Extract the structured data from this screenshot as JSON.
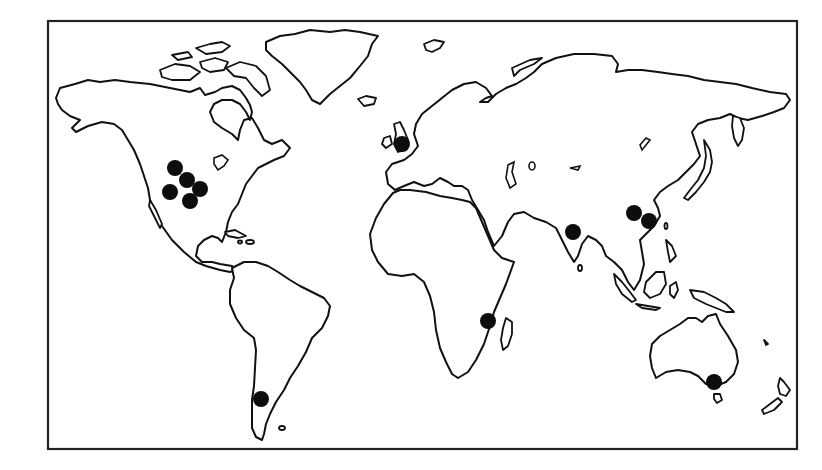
{
  "map": {
    "projection": "world outline map",
    "frame": {
      "x": 48,
      "y": 21,
      "width": 749,
      "height": 428
    },
    "colors": {
      "outline": "#111111",
      "land": "#ffffff",
      "marker": "#0d0d0d",
      "background": "#ffffff"
    },
    "marker_radius": 8,
    "markers": [
      {
        "region": "North America (western USA)",
        "x": 175,
        "y": 168
      },
      {
        "region": "North America (western USA)",
        "x": 187,
        "y": 180
      },
      {
        "region": "North America (western USA)",
        "x": 170,
        "y": 192
      },
      {
        "region": "North America (western USA)",
        "x": 200,
        "y": 189
      },
      {
        "region": "North America (western USA)",
        "x": 190,
        "y": 201
      },
      {
        "region": "Europe (England)",
        "x": 402,
        "y": 144
      },
      {
        "region": "South Asia (India)",
        "x": 573,
        "y": 232
      },
      {
        "region": "East Asia (China)",
        "x": 634,
        "y": 213
      },
      {
        "region": "East Asia (China)",
        "x": 649,
        "y": 221
      },
      {
        "region": "East Africa",
        "x": 488,
        "y": 321
      },
      {
        "region": "Australia (southeast)",
        "x": 714,
        "y": 382
      },
      {
        "region": "South America (Patagonia)",
        "x": 261,
        "y": 399
      }
    ]
  }
}
